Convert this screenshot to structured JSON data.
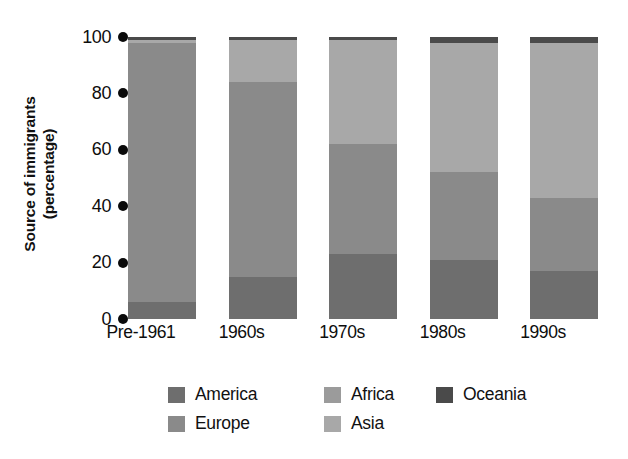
{
  "chart_data": {
    "type": "bar",
    "subtype": "stacked-bar-100-percent",
    "title": "",
    "xlabel": "",
    "ylabel": "Source of immigrants (percentage)",
    "ylabel_line1": "Source of immigrants",
    "ylabel_line2": "(percentage)",
    "ylim": [
      0,
      100
    ],
    "ytick_labels": [
      "0",
      "20",
      "40",
      "60",
      "80",
      "100"
    ],
    "ytick_values": [
      0,
      20,
      40,
      60,
      80,
      100
    ],
    "grid": false,
    "legend_position": "bottom",
    "categories": [
      "Pre-1961",
      "1960s",
      "1970s",
      "1980s",
      "1990s"
    ],
    "series": [
      {
        "name": "America",
        "color": "#6e6e6e",
        "values": [
          6,
          15,
          23,
          21,
          17
        ]
      },
      {
        "name": "Europe",
        "color": "#8a8a8a",
        "values": [
          92,
          69,
          39,
          31,
          26
        ]
      },
      {
        "name": "Africa",
        "color": "#9b9b9b",
        "values": [
          0,
          0,
          0,
          0,
          0
        ]
      },
      {
        "name": "Asia",
        "color": "#a8a8a8",
        "values": [
          1,
          15,
          37,
          46,
          55
        ]
      },
      {
        "name": "Oceania",
        "color": "#4a4a4a",
        "values": [
          1,
          1,
          1,
          2,
          2
        ]
      }
    ]
  },
  "legend": {
    "columns": [
      {
        "items": [
          {
            "label": "America",
            "color": "#6e6e6e"
          },
          {
            "label": "Europe",
            "color": "#8a8a8a"
          }
        ]
      },
      {
        "items": [
          {
            "label": "Africa",
            "color": "#9b9b9b"
          },
          {
            "label": "Asia",
            "color": "#a8a8a8"
          }
        ]
      },
      {
        "items": [
          {
            "label": "Oceania",
            "color": "#4a4a4a"
          }
        ]
      }
    ]
  }
}
